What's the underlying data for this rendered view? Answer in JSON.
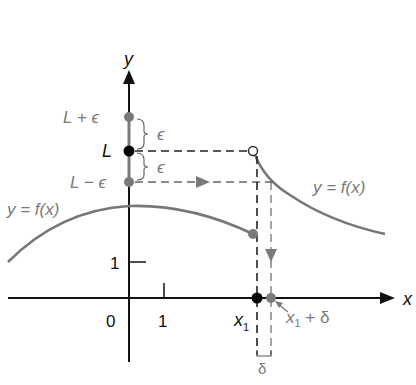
{
  "figure": {
    "axes": {
      "x_label": "x",
      "y_label": "y",
      "x_tick_0": "0",
      "x_tick_1": "1",
      "y_tick_1": "1"
    },
    "y_markers": {
      "upper": "L + ϵ",
      "center": "L",
      "lower": "L − ϵ",
      "epsilon_upper": "ϵ",
      "epsilon_lower": "ϵ"
    },
    "x_markers": {
      "x1": "x",
      "x1_sub": "1",
      "x1_plus_delta": "x",
      "x1_plus_delta_sub": "1",
      "x1_plus_delta_suffix": "+ δ",
      "delta": "δ"
    },
    "curves": {
      "left_label": "y = f(x)",
      "right_label": "y = f(x)"
    },
    "colors": {
      "axis": "#111111",
      "curve": "#777777",
      "black_dot": "#000000",
      "gray_dot": "#7a7a7a"
    }
  }
}
